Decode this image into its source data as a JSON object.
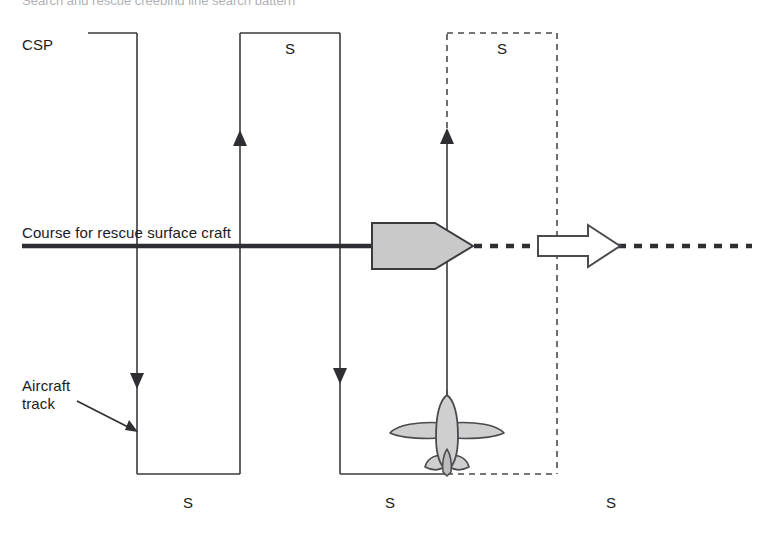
{
  "diagram": {
    "title_cut_off": "Search and rescue creeping line search pattern",
    "labels": {
      "csp": "CSP",
      "course": "Course for rescue surface craft",
      "aircraft_track_line1": "Aircraft",
      "aircraft_track_line2": "track",
      "s_top_solid": "S",
      "s_top_dashed": "S",
      "s_bottom_1": "S",
      "s_bottom_2": "S",
      "s_bottom_3": "S"
    },
    "colors": {
      "line": "#3a3a3f",
      "text": "#1a1a1a",
      "ship_fill": "#c9c9c9",
      "ship_stroke": "#3a3a3f",
      "arrow_fill": "#ffffff",
      "arrow_stroke": "#4a4a4f",
      "aircraft_fill": "#cfcfcf",
      "aircraft_stroke": "#4a4a4f",
      "background": "#ffffff"
    },
    "geometry": {
      "course_line_y": 246,
      "course_solid_x_start": 22,
      "course_solid_x_end": 372,
      "course_dotted_x_start": 472,
      "course_dotted_x_end": 752,
      "track_top_y": 33,
      "track_bottom_y": 474,
      "legs_solid": [
        137,
        240,
        340
      ],
      "legs_dashed": [
        447,
        557
      ],
      "arrow_up_solid_x": 240,
      "arrow_up_dashed_x": 447,
      "arrow_down_x": [
        137,
        340
      ]
    }
  }
}
